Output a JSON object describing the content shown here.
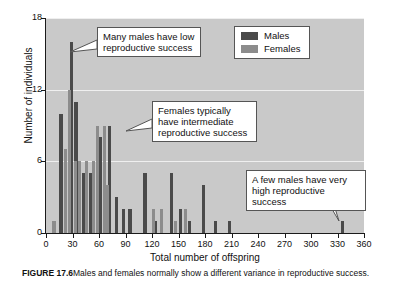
{
  "chart_data": {
    "type": "bar",
    "title": "",
    "xlabel": "Total number of offspring",
    "ylabel": "Number of individuals",
    "xlim": [
      0,
      360
    ],
    "ylim": [
      0,
      18
    ],
    "xticks": [
      0,
      30,
      60,
      90,
      120,
      150,
      180,
      210,
      240,
      270,
      300,
      330,
      360
    ],
    "yticks": [
      0,
      6,
      12,
      18
    ],
    "grid": "horizontal",
    "legend_position": "top-right",
    "series": [
      {
        "name": "Males",
        "color": "#4a4a4a",
        "points": [
          {
            "x": 17,
            "y": 10
          },
          {
            "x": 29,
            "y": 16
          },
          {
            "x": 34,
            "y": 11
          },
          {
            "x": 42,
            "y": 5
          },
          {
            "x": 50,
            "y": 5
          },
          {
            "x": 62,
            "y": 8
          },
          {
            "x": 72,
            "y": 9
          },
          {
            "x": 80,
            "y": 3
          },
          {
            "x": 88,
            "y": 2
          },
          {
            "x": 95,
            "y": 2
          },
          {
            "x": 112,
            "y": 5
          },
          {
            "x": 124,
            "y": 1
          },
          {
            "x": 142,
            "y": 5
          },
          {
            "x": 152,
            "y": 2
          },
          {
            "x": 162,
            "y": 1
          },
          {
            "x": 178,
            "y": 4
          },
          {
            "x": 192,
            "y": 1
          },
          {
            "x": 208,
            "y": 1
          },
          {
            "x": 336,
            "y": 1
          }
        ]
      },
      {
        "name": "Females",
        "color": "#8c8c8c",
        "points": [
          {
            "x": 9,
            "y": 1
          },
          {
            "x": 22,
            "y": 7
          },
          {
            "x": 27,
            "y": 12
          },
          {
            "x": 33,
            "y": 6
          },
          {
            "x": 38,
            "y": 6
          },
          {
            "x": 46,
            "y": 6
          },
          {
            "x": 54,
            "y": 6
          },
          {
            "x": 58,
            "y": 9
          },
          {
            "x": 66,
            "y": 9
          },
          {
            "x": 70,
            "y": 4
          },
          {
            "x": 122,
            "y": 2
          },
          {
            "x": 131,
            "y": 2
          },
          {
            "x": 147,
            "y": 1
          },
          {
            "x": 158,
            "y": 2
          }
        ]
      }
    ]
  },
  "axes": {
    "ylabel": "Number of individuals",
    "xlabel": "Total number of offspring",
    "yticks": [
      "0",
      "6",
      "12",
      "18"
    ],
    "xticks": [
      "0",
      "30",
      "60",
      "90",
      "120",
      "150",
      "180",
      "210",
      "240",
      "270",
      "300",
      "330",
      "360"
    ]
  },
  "legend": {
    "items": [
      {
        "label": "Males",
        "color": "#4a4a4a"
      },
      {
        "label": "Females",
        "color": "#8c8c8c"
      }
    ]
  },
  "callouts": {
    "males_low": "Many males have low reproductive success",
    "females_intermediate": "Females typically have intermediate reproductive success",
    "males_high": "A few males have very high reproductive success"
  },
  "caption": {
    "figure_number": "FIGURE 17.6",
    "text": "Males and females normally show a different variance in reproductive success."
  }
}
